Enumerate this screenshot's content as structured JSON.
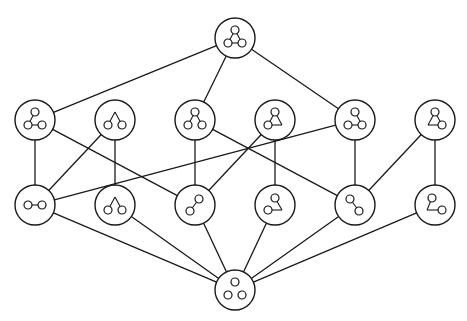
{
  "diagram": {
    "title": "",
    "type": "hasse-lattice-of-graphs",
    "canvas": {
      "width": 467,
      "height": 321
    },
    "colors": {
      "stroke": "#1a1a1a",
      "background": "#ffffff"
    },
    "node_radius": 20,
    "vertex_radius": 4,
    "nodes": [
      {
        "id": "top",
        "label": "triangle",
        "x": 235,
        "y": 38,
        "vertices": [
          [
            0,
            -8
          ],
          [
            -7,
            5
          ],
          [
            7,
            5
          ]
        ],
        "segments": [
          [
            [
              0,
              -8
            ],
            [
              -7,
              5
            ]
          ],
          [
            [
              0,
              -8
            ],
            [
              7,
              5
            ]
          ],
          [
            [
              -7,
              5
            ],
            [
              7,
              5
            ]
          ]
        ]
      },
      {
        "id": "r2a",
        "label": "path-top-bottomleft-bottomright",
        "x": 35,
        "y": 120,
        "vertices": [
          [
            0,
            -8
          ],
          [
            -7,
            5
          ],
          [
            7,
            5
          ]
        ],
        "segments": [
          [
            [
              0,
              -8
            ],
            [
              -7,
              5
            ]
          ],
          [
            [
              -7,
              5
            ],
            [
              7,
              5
            ]
          ]
        ]
      },
      {
        "id": "r2b",
        "label": "two-vertices-hat",
        "x": 115,
        "y": 120,
        "vertices": [
          [
            -7,
            5
          ],
          [
            7,
            5
          ]
        ],
        "segments": [
          [
            [
              -7,
              5
            ],
            [
              0,
              -8
            ]
          ],
          [
            [
              0,
              -8
            ],
            [
              7,
              5
            ]
          ]
        ]
      },
      {
        "id": "r2c",
        "label": "path-bottomleft-top-bottomright",
        "x": 195,
        "y": 120,
        "vertices": [
          [
            0,
            -8
          ],
          [
            -7,
            5
          ],
          [
            7,
            5
          ]
        ],
        "segments": [
          [
            [
              0,
              -8
            ],
            [
              -7,
              5
            ]
          ],
          [
            [
              0,
              -8
            ],
            [
              7,
              5
            ]
          ]
        ]
      },
      {
        "id": "r2d",
        "label": "two-vertices-triangle-corner-right",
        "x": 275,
        "y": 120,
        "vertices": [
          [
            0,
            -8
          ],
          [
            -7,
            5
          ]
        ],
        "segments": [
          [
            [
              0,
              -8
            ],
            [
              -7,
              5
            ]
          ],
          [
            [
              0,
              -8
            ],
            [
              7,
              5
            ]
          ],
          [
            [
              7,
              5
            ],
            [
              -7,
              5
            ]
          ]
        ]
      },
      {
        "id": "r2e",
        "label": "path-top-bottomright-bottomleft",
        "x": 355,
        "y": 120,
        "vertices": [
          [
            0,
            -8
          ],
          [
            -7,
            5
          ],
          [
            7,
            5
          ]
        ],
        "segments": [
          [
            [
              0,
              -8
            ],
            [
              7,
              5
            ]
          ],
          [
            [
              -7,
              5
            ],
            [
              7,
              5
            ]
          ]
        ]
      },
      {
        "id": "r2f",
        "label": "two-vertices-triangle-corner-left",
        "x": 435,
        "y": 120,
        "vertices": [
          [
            0,
            -8
          ],
          [
            7,
            5
          ]
        ],
        "segments": [
          [
            [
              0,
              -8
            ],
            [
              7,
              5
            ]
          ],
          [
            [
              0,
              -8
            ],
            [
              -7,
              5
            ]
          ],
          [
            [
              -7,
              5
            ],
            [
              7,
              5
            ]
          ]
        ]
      },
      {
        "id": "r3a",
        "label": "edge-horizontal",
        "x": 35,
        "y": 205,
        "vertices": [
          [
            -7,
            0
          ],
          [
            7,
            0
          ]
        ],
        "segments": [
          [
            [
              -7,
              0
            ],
            [
              7,
              0
            ]
          ]
        ]
      },
      {
        "id": "r3b",
        "label": "two-vertices-hat",
        "x": 115,
        "y": 205,
        "vertices": [
          [
            -7,
            5
          ],
          [
            7,
            5
          ]
        ],
        "segments": [
          [
            [
              -7,
              5
            ],
            [
              0,
              -8
            ]
          ],
          [
            [
              0,
              -8
            ],
            [
              7,
              5
            ]
          ]
        ]
      },
      {
        "id": "r3c",
        "label": "edge-diagonal-up-right",
        "x": 195,
        "y": 205,
        "vertices": [
          [
            4,
            -6
          ],
          [
            -5,
            6
          ]
        ],
        "segments": [
          [
            [
              4,
              -6
            ],
            [
              -5,
              6
            ]
          ]
        ]
      },
      {
        "id": "r3d",
        "label": "two-vertices-corner-right",
        "x": 275,
        "y": 205,
        "vertices": [
          [
            0,
            -7
          ],
          [
            -7,
            5
          ]
        ],
        "segments": [
          [
            [
              0,
              -7
            ],
            [
              7,
              5
            ]
          ],
          [
            [
              7,
              5
            ],
            [
              -7,
              5
            ]
          ]
        ]
      },
      {
        "id": "r3e",
        "label": "edge-diagonal-down-right",
        "x": 355,
        "y": 205,
        "vertices": [
          [
            -5,
            -6
          ],
          [
            4,
            6
          ]
        ],
        "segments": [
          [
            [
              -5,
              -6
            ],
            [
              4,
              6
            ]
          ]
        ]
      },
      {
        "id": "r3f",
        "label": "two-vertices-corner-left",
        "x": 435,
        "y": 205,
        "vertices": [
          [
            -3,
            -7
          ],
          [
            7,
            5
          ]
        ],
        "segments": [
          [
            [
              -3,
              -7
            ],
            [
              -8,
              5
            ]
          ],
          [
            [
              -8,
              5
            ],
            [
              7,
              5
            ]
          ]
        ]
      },
      {
        "id": "bottom",
        "label": "three-isolated-vertices",
        "x": 235,
        "y": 290,
        "vertices": [
          [
            0,
            -8
          ],
          [
            -7,
            5
          ],
          [
            7,
            5
          ]
        ],
        "segments": []
      }
    ],
    "edges": [
      [
        "top",
        "r2a"
      ],
      [
        "top",
        "r2c"
      ],
      [
        "top",
        "r2e"
      ],
      [
        "r2a",
        "r3a"
      ],
      [
        "r2a",
        "r3c"
      ],
      [
        "r2b",
        "r3a"
      ],
      [
        "r2b",
        "r3b"
      ],
      [
        "r2c",
        "r3c"
      ],
      [
        "r2c",
        "r3e"
      ],
      [
        "r2d",
        "r3c"
      ],
      [
        "r2d",
        "r3d"
      ],
      [
        "r2e",
        "r3a"
      ],
      [
        "r2e",
        "r3e"
      ],
      [
        "r2f",
        "r3e"
      ],
      [
        "r2f",
        "r3f"
      ],
      [
        "r3a",
        "bottom"
      ],
      [
        "r3b",
        "bottom"
      ],
      [
        "r3c",
        "bottom"
      ],
      [
        "r3d",
        "bottom"
      ],
      [
        "r3e",
        "bottom"
      ],
      [
        "r3f",
        "bottom"
      ]
    ]
  }
}
